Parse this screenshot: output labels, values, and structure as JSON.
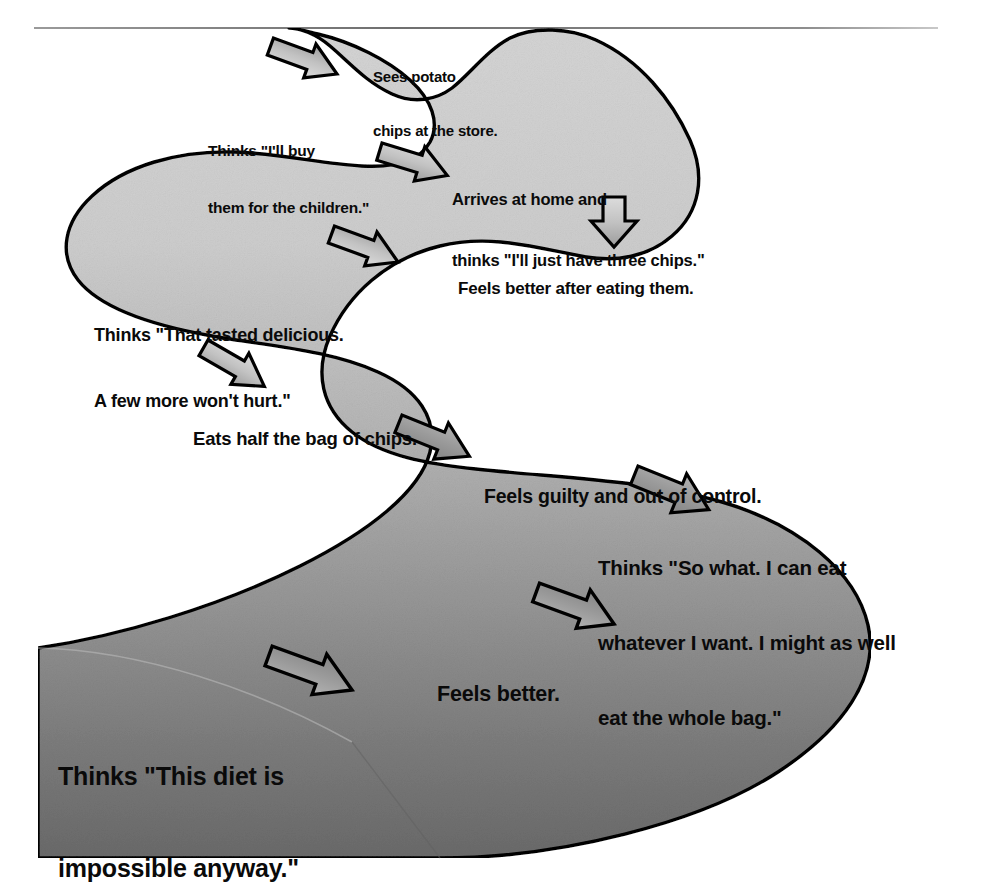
{
  "diagram": {
    "type": "flow-path",
    "colors": {
      "outline": "#000000",
      "fill_top": "#d2d2d2",
      "fill_bottom": "#6d6d6d",
      "arrow_fill_top": "#d6d6d6",
      "arrow_fill_bottom": "#8a8a8a",
      "rule": "#7b7b7b",
      "text": "#0a0a0a"
    },
    "top_rule": true,
    "steps": [
      {
        "id": "step-1",
        "line1": "Sees potato",
        "line2": "chips at the store.",
        "line3": ""
      },
      {
        "id": "step-2",
        "line1": "Thinks \"I'll buy",
        "line2": "them for the children.\"",
        "line3": ""
      },
      {
        "id": "step-3",
        "line1": "Arrives at home and",
        "line2": "thinks \"I'll just have three chips.\"",
        "line3": ""
      },
      {
        "id": "step-4",
        "line1": "Feels better after eating them.",
        "line2": "",
        "line3": ""
      },
      {
        "id": "step-5",
        "line1": "Thinks \"That tasted delicious.",
        "line2": "A few more won't hurt.\"",
        "line3": ""
      },
      {
        "id": "step-6",
        "line1": "Eats half the bag of chips.",
        "line2": "",
        "line3": ""
      },
      {
        "id": "step-7",
        "line1": "Feels guilty and out of control.",
        "line2": "",
        "line3": ""
      },
      {
        "id": "step-8",
        "line1": "Thinks \"So what. I can eat",
        "line2": "whatever I want. I might as well",
        "line3": "eat the whole bag.\""
      },
      {
        "id": "step-9",
        "line1": "Feels better.",
        "line2": "",
        "line3": ""
      },
      {
        "id": "step-10",
        "line1": "Thinks \"This diet is",
        "line2": "impossible anyway.\"",
        "line3": ""
      }
    ],
    "arrows": [
      {
        "id": "arrow-1",
        "icon": "bent-arrow-down-left-icon",
        "direction": "down-left",
        "between": "step-1 -> step-2"
      },
      {
        "id": "arrow-2",
        "icon": "bent-arrow-down-right-icon",
        "direction": "down-right",
        "between": "step-2 -> step-3"
      },
      {
        "id": "arrow-3",
        "icon": "arrow-down-icon",
        "direction": "down",
        "between": "step-3 -> step-4"
      },
      {
        "id": "arrow-4",
        "icon": "bent-arrow-down-left-icon",
        "direction": "down-left",
        "between": "step-4 -> step-5"
      },
      {
        "id": "arrow-5",
        "icon": "bent-arrow-down-right-icon",
        "direction": "down-right",
        "between": "step-5 -> step-6"
      },
      {
        "id": "arrow-6",
        "icon": "bent-arrow-down-right-icon",
        "direction": "down-right",
        "between": "step-6 -> step-7"
      },
      {
        "id": "arrow-7",
        "icon": "bent-arrow-down-right-icon",
        "direction": "down-right",
        "between": "step-7 -> step-8"
      },
      {
        "id": "arrow-8",
        "icon": "bent-arrow-down-left-icon",
        "direction": "down-left",
        "between": "step-8 -> step-9"
      },
      {
        "id": "arrow-9",
        "icon": "bent-arrow-down-left-icon",
        "direction": "down-left",
        "between": "step-9 -> step-10"
      }
    ]
  }
}
